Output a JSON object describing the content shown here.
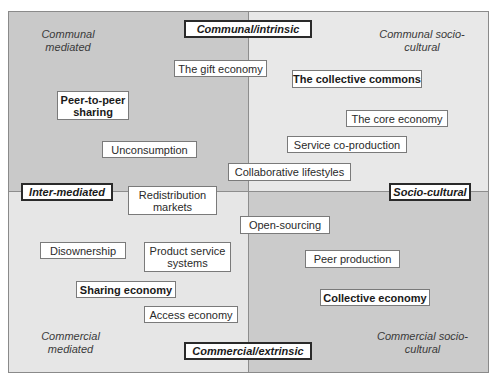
{
  "axes": {
    "top": "Communal/intrinsic",
    "bottom": "Commercial/extrinsic",
    "left": "Inter-mediated",
    "right": "Socio-cultural"
  },
  "quadrants": {
    "top_left": {
      "label": "Communal mediated",
      "color": "#c9c9c9"
    },
    "top_right": {
      "label": "Communal socio-cultural",
      "color": "#e8e8e8"
    },
    "bottom_left": {
      "label": "Commercial mediated",
      "color": "#e6e6e6"
    },
    "bottom_right": {
      "label": "Commercial socio-cultural",
      "color": "#cbcbcb"
    }
  },
  "corner_lines": {
    "top_left": [
      "Communal",
      "mediated"
    ],
    "top_right": [
      "Communal socio-",
      "cultural"
    ],
    "bottom_left": [
      "Commercial",
      "mediated"
    ],
    "bottom_right": [
      "Commercial socio-",
      "cultural"
    ]
  },
  "concepts": [
    {
      "label": "The gift economy",
      "bold": false
    },
    {
      "label": "The collective commons",
      "bold": true
    },
    {
      "label": "Peer-to-peer sharing",
      "line1": "Peer-to-peer",
      "line2": "sharing",
      "bold": true
    },
    {
      "label": "The core economy",
      "bold": false
    },
    {
      "label": "Service co-production",
      "bold": false
    },
    {
      "label": "Unconsumption",
      "bold": false
    },
    {
      "label": "Collaborative lifestyles",
      "bold": false
    },
    {
      "label": "Redistribution markets",
      "line1": "Redistribution",
      "line2": "markets",
      "bold": false
    },
    {
      "label": "Open-sourcing",
      "bold": false
    },
    {
      "label": "Disownership",
      "bold": false
    },
    {
      "label": "Product service systems",
      "line1": "Product service",
      "line2": "systems",
      "bold": false
    },
    {
      "label": "Peer production",
      "bold": false
    },
    {
      "label": "Sharing economy",
      "bold": true
    },
    {
      "label": "Collective economy",
      "bold": true
    },
    {
      "label": "Access economy",
      "bold": false
    }
  ]
}
